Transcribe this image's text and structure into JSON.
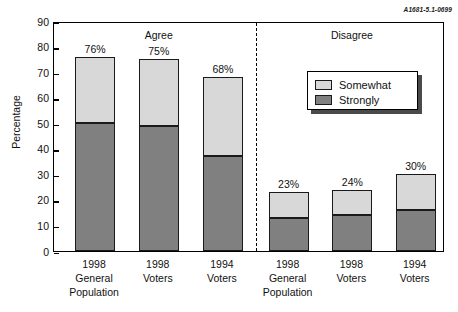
{
  "corner_id": "A1681-5.1-0699",
  "legend": {
    "items": [
      {
        "label": "Somewhat",
        "color": "#d8d8d8",
        "swatch_name": "legend-swatch-somewhat"
      },
      {
        "label": "Strongly",
        "color": "#808080",
        "swatch_name": "legend-swatch-strongly"
      }
    ]
  },
  "chart_data": {
    "type": "bar",
    "subtype": "stacked-bar",
    "title": "",
    "xlabel": "",
    "ylabel": "Percentage",
    "ylim": [
      0,
      90
    ],
    "yticks": [
      0,
      10,
      20,
      30,
      40,
      50,
      60,
      70,
      80,
      90
    ],
    "ytick_labels": [
      "0",
      "10",
      "20",
      "30",
      "40",
      "50",
      "60",
      "70",
      "80",
      "90"
    ],
    "grid": false,
    "legend_position": "upper-right",
    "groups": [
      {
        "name": "Agree",
        "label": "Agree"
      },
      {
        "name": "Disagree",
        "label": "Disagree"
      }
    ],
    "categories": [
      "1998 General Population",
      "1998 Voters",
      "1994 Voters",
      "1998 General Population",
      "1998 Voters",
      "1994 Voters"
    ],
    "series": [
      {
        "name": "Strongly",
        "color": "#808080",
        "values": [
          50,
          49,
          37,
          13,
          14,
          16
        ]
      },
      {
        "name": "Somewhat",
        "color": "#d8d8d8",
        "values": [
          26,
          26,
          31,
          10,
          10,
          14
        ]
      }
    ],
    "bars": [
      {
        "group": "Agree",
        "category_lines": [
          "1998",
          "General",
          "Population"
        ],
        "strongly": 50,
        "somewhat": 26,
        "total": 76,
        "total_label": "76%"
      },
      {
        "group": "Agree",
        "category_lines": [
          "1998",
          "Voters"
        ],
        "strongly": 49,
        "somewhat": 26,
        "total": 75,
        "total_label": "75%"
      },
      {
        "group": "Agree",
        "category_lines": [
          "1994",
          "Voters"
        ],
        "strongly": 37,
        "somewhat": 31,
        "total": 68,
        "total_label": "68%"
      },
      {
        "group": "Disagree",
        "category_lines": [
          "1998",
          "General",
          "Population"
        ],
        "strongly": 13,
        "somewhat": 10,
        "total": 23,
        "total_label": "23%"
      },
      {
        "group": "Disagree",
        "category_lines": [
          "1998",
          "Voters"
        ],
        "strongly": 14,
        "somewhat": 10,
        "total": 24,
        "total_label": "24%"
      },
      {
        "group": "Disagree",
        "category_lines": [
          "1994",
          "Voters"
        ],
        "strongly": 16,
        "somewhat": 14,
        "total": 30,
        "total_label": "30%"
      }
    ]
  }
}
